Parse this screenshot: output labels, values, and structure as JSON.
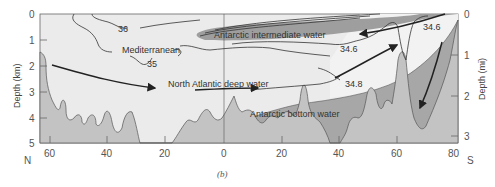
{
  "figure": {
    "caption": "(b)",
    "colors": {
      "background": "#ebebeb",
      "seafloor": "#c3c3c3",
      "intermediate_water": "#9e9e9e",
      "bottom_water": "#a7a7a7",
      "line": "#333333"
    },
    "axes": {
      "left_title": "Depth (km)",
      "right_title": "Depth (mi)",
      "left_ticks": [
        "0",
        "1",
        "2",
        "3",
        "4",
        "5"
      ],
      "right_ticks": [
        "0",
        "1",
        "2",
        "3"
      ],
      "bottom_ticks": [
        "60",
        "40",
        "20",
        "0",
        "20",
        "40",
        "60",
        "80"
      ],
      "left_end": "N",
      "right_end": "S"
    },
    "labels": {
      "antarctic_intermediate": "Antarctic intermediate water",
      "mediterranean": "Mediterranean",
      "north_atlantic_deep": "North Atlantic deep water",
      "antarctic_bottom": "Antarctic bottom water",
      "iso_36": "36",
      "iso_35": "35",
      "iso_346_a": "34.6",
      "iso_346_b": "34.6",
      "iso_348": "34.8"
    }
  }
}
